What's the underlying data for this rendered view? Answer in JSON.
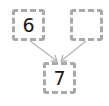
{
  "diagram": {
    "nodes": [
      {
        "id": "a",
        "label": "6"
      },
      {
        "id": "b",
        "label": ""
      },
      {
        "id": "c",
        "label": "7"
      }
    ],
    "edges": [
      {
        "from": "a",
        "to": "c"
      },
      {
        "from": "b",
        "to": "c"
      }
    ],
    "colors": {
      "border": "#a9a9a9",
      "arrow": "#b5b5b5",
      "text": "#1a1a1a"
    }
  }
}
